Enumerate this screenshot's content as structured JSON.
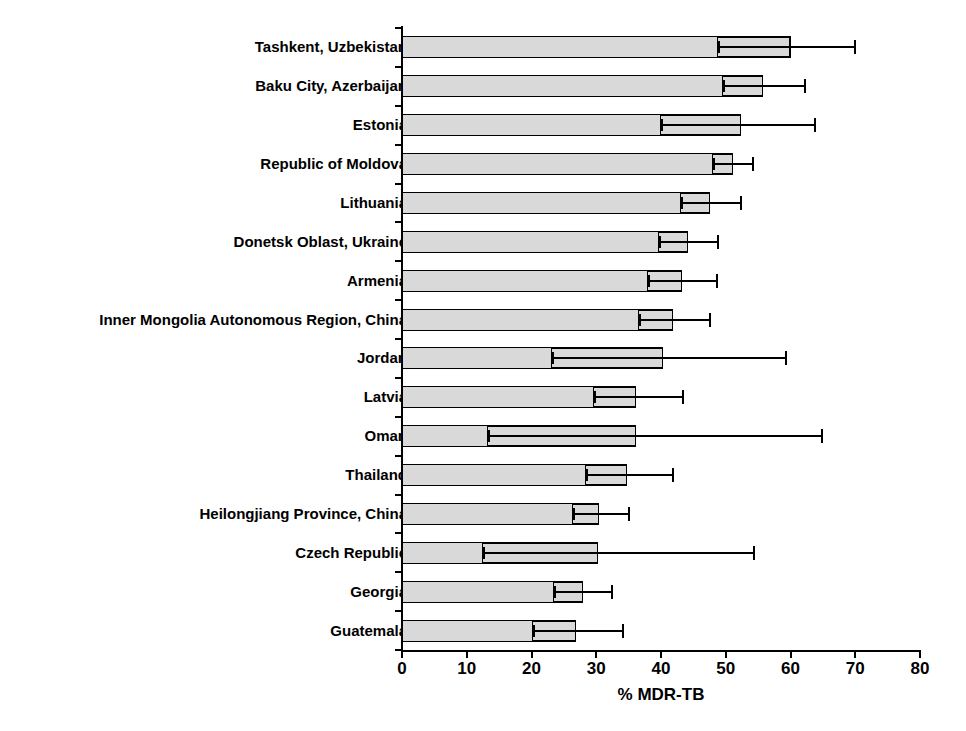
{
  "chart_data": {
    "type": "bar",
    "orientation": "horizontal",
    "title": "",
    "xlabel": "% MDR-TB",
    "ylabel": "",
    "xlim": [
      0,
      80
    ],
    "xticks": [
      0,
      10,
      20,
      30,
      40,
      50,
      60,
      70,
      80
    ],
    "xtick_labels": [
      "0",
      "10",
      "20",
      "30",
      "40",
      "50",
      "60",
      "70",
      "80"
    ],
    "grid": false,
    "legend": null,
    "error_bar_style": "box-and-whisker confidence interval",
    "bar_color": "#d9d9d9",
    "bar_edge_color": "#000000",
    "categories": [
      "Tashkent, Uzbekistan",
      "Baku City, Azerbaijan",
      "Estonia",
      "Republic of Moldova",
      "Lithuania",
      "Donetsk Oblast, Ukraine",
      "Armenia",
      "Inner Mongolia Autonomous Region, China",
      "Jordan",
      "Latvia",
      "Oman",
      "Thailand",
      "Heilongjiang Province, China",
      "Czech Republic",
      "Georgia",
      "Guatemala"
    ],
    "values": [
      60.0,
      55.7,
      52.4,
      51.1,
      47.5,
      44.1,
      43.2,
      41.8,
      40.3,
      36.2,
      36.1,
      34.7,
      30.4,
      30.2,
      27.9,
      26.8
    ],
    "ci_lower": [
      48.6,
      49.4,
      39.8,
      47.8,
      42.9,
      39.6,
      37.8,
      36.4,
      23.0,
      29.5,
      13.1,
      28.2,
      26.3,
      12.3,
      23.3,
      20.1
    ],
    "ci_upper": [
      70.0,
      62.3,
      63.8,
      54.2,
      52.4,
      48.8,
      48.6,
      47.5,
      59.3,
      43.4,
      64.9,
      41.8,
      35.0,
      54.4,
      32.5,
      34.2
    ]
  }
}
